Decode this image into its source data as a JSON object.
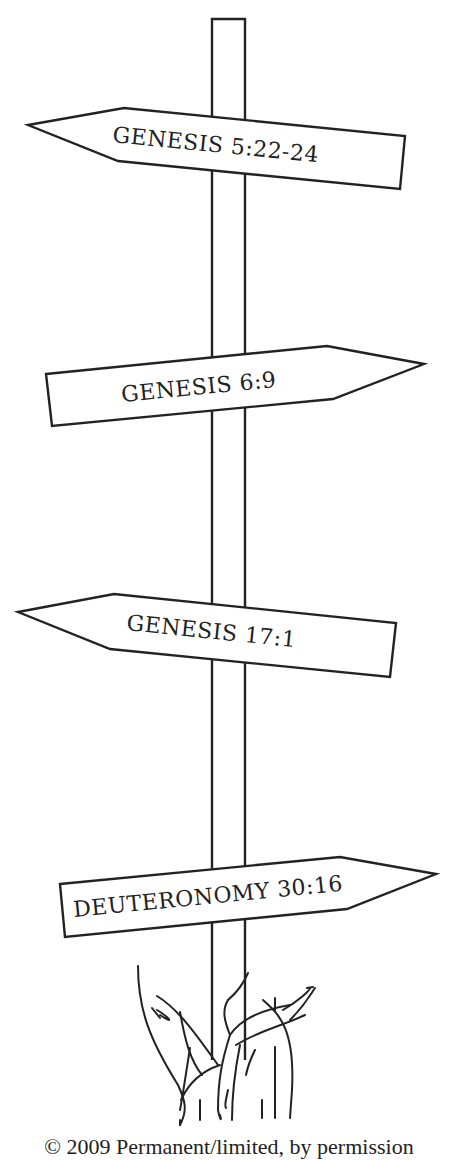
{
  "illustration": {
    "title": "Signpost with scripture references",
    "colors": {
      "line": "#222222",
      "background": "#ffffff",
      "fill": "#ffffff"
    },
    "signs": [
      {
        "label": "GENESIS 5:22-24",
        "direction": "left"
      },
      {
        "label": "GENESIS 6:9",
        "direction": "right"
      },
      {
        "label": "GENESIS 17:1",
        "direction": "left"
      },
      {
        "label": "DEUTERONOMY 30:16",
        "direction": "right"
      }
    ],
    "caption": "© 2009 Permanent/limited, by permission"
  }
}
